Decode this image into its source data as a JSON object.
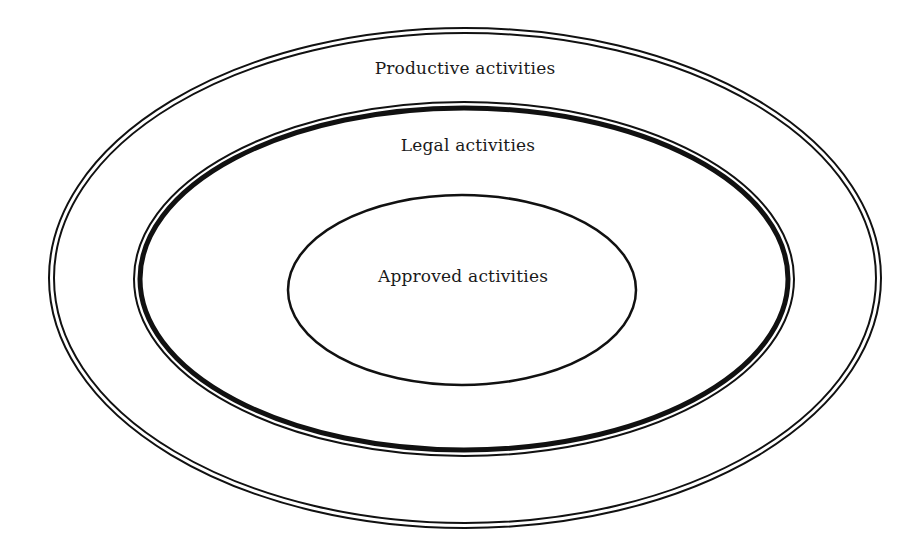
{
  "diagram": {
    "type": "nested-ellipses",
    "colors": {
      "stroke": "#111111",
      "background": "#ffffff",
      "text": "#1a1a1a"
    },
    "sets": [
      {
        "id": "outer",
        "label": "Productive activities",
        "cx": 465,
        "cy": 278,
        "rx": 416,
        "ry": 250,
        "border": "double-thin"
      },
      {
        "id": "middle",
        "label": "Legal activities",
        "cx": 464,
        "cy": 279,
        "rx": 330,
        "ry": 177,
        "border": "thick-with-thin-outer"
      },
      {
        "id": "inner",
        "label": "Approved activities",
        "cx": 462,
        "cy": 290,
        "rx": 174,
        "ry": 95,
        "border": "single"
      }
    ]
  }
}
